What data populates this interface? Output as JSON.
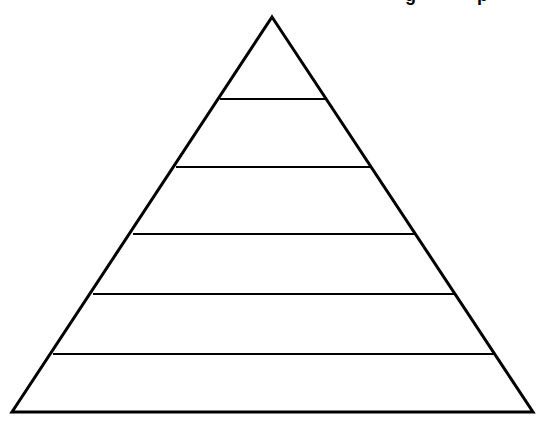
{
  "diagram": {
    "type": "pyramid",
    "title_fragment_visible": "cut off at top edge (only descenders visible)",
    "header_fragments": [
      {
        "text": "g",
        "x": 405
      },
      {
        "text": "p",
        "x": 477
      }
    ],
    "stroke_color": "#000000",
    "background_color": "#ffffff",
    "triangle": {
      "apex": {
        "x": 272,
        "y": 17
      },
      "base_left": {
        "x": 12,
        "y": 412
      },
      "base_right": {
        "x": 533,
        "y": 412
      },
      "stroke_width": 3
    },
    "tiers": [
      {
        "level": 1,
        "label": ""
      },
      {
        "level": 2,
        "label": ""
      },
      {
        "level": 3,
        "label": ""
      },
      {
        "level": 4,
        "label": ""
      },
      {
        "level": 5,
        "label": ""
      },
      {
        "level": 6,
        "label": ""
      }
    ],
    "divider_lines": [
      {
        "y": 99,
        "x1": 220,
        "x2": 325
      },
      {
        "y": 167,
        "x1": 176,
        "x2": 370
      },
      {
        "y": 234,
        "x1": 133,
        "x2": 414
      },
      {
        "y": 294,
        "x1": 93,
        "x2": 455
      },
      {
        "y": 354,
        "x1": 53,
        "x2": 494
      }
    ],
    "divider_stroke_width": 2
  }
}
